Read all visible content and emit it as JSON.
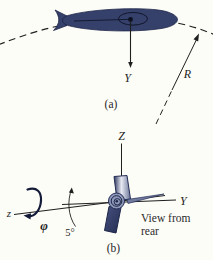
{
  "figure_type": "physics textbook diagram, fish swimming on curved path with rear view of roll axes",
  "colors": {
    "background": "#fdfdf8",
    "ink": "#1f1f1f",
    "fish_body": "#36416b",
    "fish_dark_edge": "#1d2547",
    "fish_light": "#dde1ee",
    "fin_mid": "#707a9e"
  },
  "panel_a": {
    "y_axis_label": "Y",
    "radius_label": "R",
    "caption": "(a)"
  },
  "panel_b": {
    "vertical_axis_label": "Z",
    "horizontal_axis_label": "Y",
    "roll_axis_label": "z",
    "roll_angle_symbol": "φ",
    "bank_angle_label": "5°",
    "view_note_line1": "View from",
    "view_note_line2": "rear",
    "caption": "(b)"
  }
}
